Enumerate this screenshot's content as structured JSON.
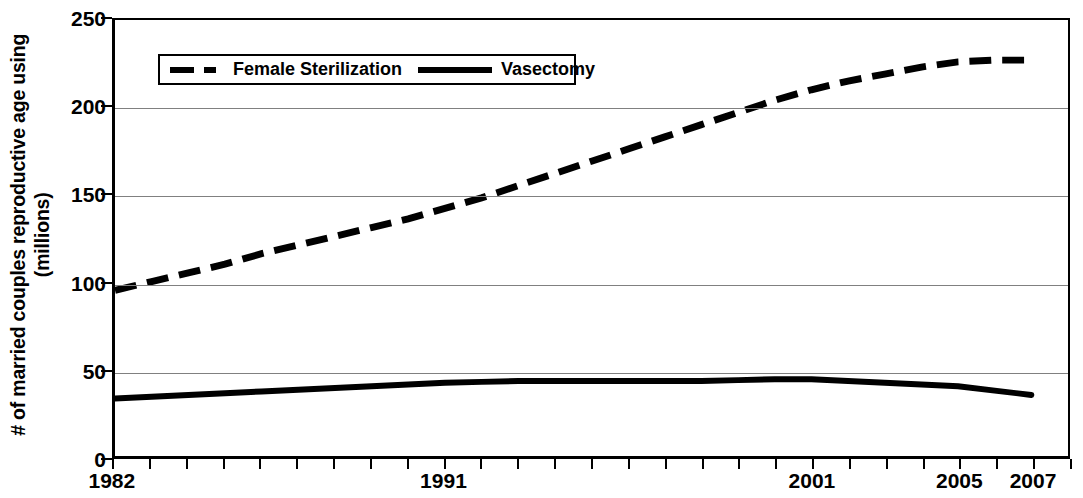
{
  "chart_data": {
    "type": "line",
    "title": "",
    "xlabel": "",
    "ylabel_line1": "# of married couples reproductive age using",
    "ylabel_line2": "(millions)",
    "x": [
      1982,
      1983,
      1984,
      1985,
      1986,
      1987,
      1988,
      1989,
      1990,
      1991,
      1992,
      1993,
      1994,
      1995,
      1996,
      1997,
      1998,
      1999,
      2000,
      2001,
      2002,
      2003,
      2004,
      2005,
      2006,
      2007
    ],
    "xlim": [
      1982,
      2008
    ],
    "ylim": [
      0,
      250
    ],
    "ytick_labels": [
      "250",
      "200",
      "150",
      "100",
      "50",
      "0"
    ],
    "ytick_values": [
      250,
      200,
      150,
      100,
      50,
      0
    ],
    "xtick_labels": [
      "1982",
      "1991",
      "2001",
      "2005",
      "2007"
    ],
    "xtick_label_values": [
      1982,
      1991,
      2001,
      2005,
      2007
    ],
    "xtick_minor_count": 26,
    "grid": "horizontal",
    "legend_position": "top-left-inside",
    "series": [
      {
        "name": "Female Sterilization",
        "style": "dashed",
        "color": "#000000",
        "values": [
          95,
          100,
          105,
          110,
          116,
          121,
          126,
          131,
          136,
          142,
          148,
          155,
          162,
          169,
          176,
          183,
          190,
          197,
          204,
          210,
          215,
          219,
          223,
          226,
          227,
          227
        ]
      },
      {
        "name": "Vasectomy",
        "style": "solid",
        "color": "#000000",
        "values": [
          33,
          34,
          35,
          36,
          37,
          38,
          39,
          40,
          41,
          42,
          42.5,
          43,
          43,
          43,
          43,
          43,
          43,
          43.5,
          44,
          44,
          43,
          42,
          41,
          40,
          37.5,
          35
        ]
      }
    ]
  },
  "legend": {
    "items": [
      {
        "label": "Female Sterilization",
        "swatch": "dashed-line-swatch"
      },
      {
        "label": "Vasectomy",
        "swatch": "solid-line-swatch"
      }
    ]
  }
}
